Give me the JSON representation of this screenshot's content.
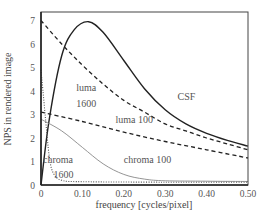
{
  "chart_data": {
    "type": "line",
    "title": "",
    "xlabel": "frequency [cycles/pixel]",
    "ylabel": "NPS in rendered image",
    "xlim": [
      0,
      0.5
    ],
    "ylim": [
      0,
      7.4
    ],
    "xticks": [
      0,
      0.1,
      0.2,
      0.3,
      0.4,
      0.5
    ],
    "xtick_labels": [
      "0",
      "0.10",
      "0.20",
      "0.30",
      "0.40",
      "0.50"
    ],
    "yticks": [
      0,
      1,
      2,
      3,
      4,
      5,
      6,
      7
    ],
    "ytick_labels": [
      "0",
      "1",
      "2",
      "3",
      "4",
      "5",
      "6",
      "7"
    ],
    "grid": false,
    "legend": "none (inline annotations)",
    "series": [
      {
        "name": "CSF",
        "style": "solid",
        "color": "#222222",
        "x": [
          0.0,
          0.02,
          0.05,
          0.08,
          0.115,
          0.15,
          0.2,
          0.25,
          0.3,
          0.35,
          0.4,
          0.45,
          0.5
        ],
        "y": [
          0.0,
          2.8,
          5.5,
          6.6,
          6.95,
          6.5,
          5.3,
          4.1,
          3.2,
          2.6,
          2.2,
          1.9,
          1.65
        ]
      },
      {
        "name": "luma 1600",
        "style": "dashed",
        "color": "#222222",
        "x": [
          0.0,
          0.05,
          0.1,
          0.15,
          0.2,
          0.25,
          0.3,
          0.35,
          0.4,
          0.45,
          0.5
        ],
        "y": [
          7.0,
          6.0,
          5.1,
          4.3,
          3.6,
          3.1,
          2.6,
          2.3,
          2.0,
          1.75,
          1.5
        ]
      },
      {
        "name": "luma 100",
        "style": "dashed",
        "color": "#222222",
        "x": [
          0.0,
          0.1,
          0.2,
          0.3,
          0.4,
          0.5
        ],
        "y": [
          3.1,
          2.7,
          2.25,
          1.85,
          1.5,
          1.15
        ]
      },
      {
        "name": "chroma 100",
        "style": "solid-thin",
        "color": "#888888",
        "x": [
          0.0,
          0.05,
          0.1,
          0.15,
          0.2,
          0.25,
          0.3,
          0.4,
          0.5
        ],
        "y": [
          2.8,
          2.3,
          1.6,
          0.9,
          0.45,
          0.25,
          0.18,
          0.16,
          0.15
        ]
      },
      {
        "name": "chroma 1600",
        "style": "dotted",
        "color": "#555555",
        "x": [
          0.0,
          0.01,
          0.02,
          0.03,
          0.05,
          0.1,
          0.3,
          0.5
        ],
        "y": [
          4.9,
          3.0,
          1.2,
          0.5,
          0.2,
          0.14,
          0.12,
          0.12
        ]
      }
    ],
    "annotations": [
      {
        "text": "CSF",
        "x": 0.33,
        "y": 3.6
      },
      {
        "text": "luma",
        "x": 0.085,
        "y": 4.0
      },
      {
        "text": "1600",
        "x": 0.085,
        "y": 3.3
      },
      {
        "text": "luma 100",
        "x": 0.18,
        "y": 2.65
      },
      {
        "text": "chroma",
        "x": 0.005,
        "y": 0.95
      },
      {
        "text": "1600",
        "x": 0.03,
        "y": 0.3
      },
      {
        "text": "chroma 100",
        "x": 0.2,
        "y": 0.95
      }
    ]
  },
  "layout": {
    "plot_left": 41,
    "plot_right": 248,
    "plot_top": 12,
    "plot_bottom": 185
  }
}
